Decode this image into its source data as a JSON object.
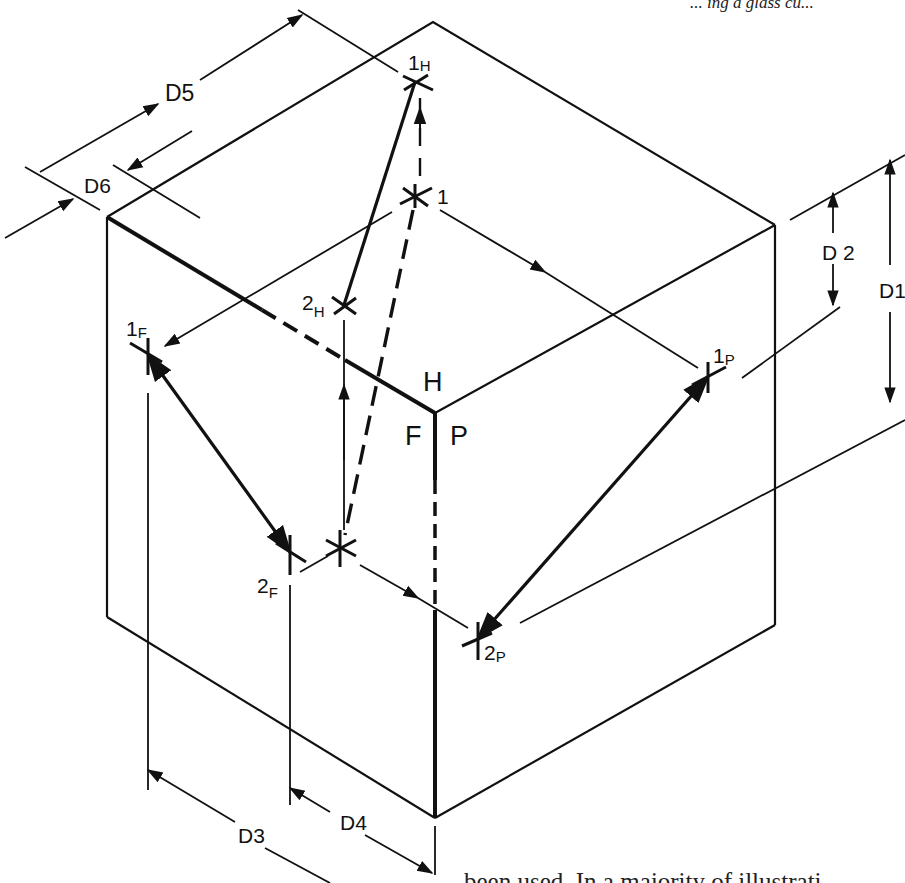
{
  "figure": {
    "type": "isometric-cube-projection-drawing",
    "face_labels": {
      "top": "H",
      "front": "F",
      "profile": "P"
    },
    "points": {
      "p1": {
        "main": "1",
        "sub": ""
      },
      "p1H": {
        "main": "1",
        "sub": "H"
      },
      "p2H": {
        "main": "2",
        "sub": "H"
      },
      "p1F": {
        "main": "1",
        "sub": "F"
      },
      "p2F": {
        "main": "2",
        "sub": "F"
      },
      "p1P": {
        "main": "1",
        "sub": "P"
      },
      "p2P": {
        "main": "2",
        "sub": "P"
      }
    },
    "dimensions": {
      "d1": "D1",
      "d2": "D 2",
      "d3": "D3",
      "d4": "D4",
      "d5": "D5",
      "d6": "D6"
    }
  },
  "page_text": {
    "top_fragment": "... ing a glass cu...",
    "bottom_fragment": "been used. In a majority of illustrati"
  },
  "colors": {
    "ink": "#111111",
    "paper": "#ffffff"
  }
}
